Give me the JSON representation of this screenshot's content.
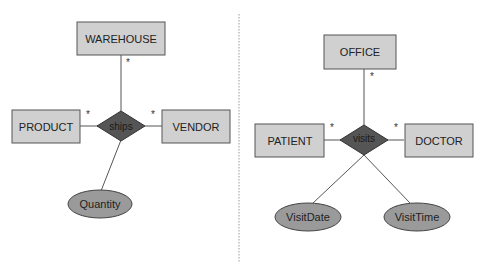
{
  "diagrams": [
    {
      "name": "ships-diagram",
      "relationship": "ships",
      "entities": {
        "top": "WAREHOUSE",
        "left": "PRODUCT",
        "right": "VENDOR"
      },
      "attributes": [
        "Quantity"
      ],
      "multiplicity": {
        "top": "*",
        "left": "*",
        "right": "*"
      }
    },
    {
      "name": "visits-diagram",
      "relationship": "visits",
      "entities": {
        "top": "OFFICE",
        "left": "PATIENT",
        "right": "DOCTOR"
      },
      "attributes": [
        "VisitDate",
        "VisitTime"
      ],
      "multiplicity": {
        "top": "*",
        "left": "*",
        "right": "*"
      }
    }
  ],
  "colors": {
    "entity_fill": "#d0d0d0",
    "relationship_fill": "#555555",
    "attribute_fill": "#9a9a9a",
    "line": "#555555"
  }
}
